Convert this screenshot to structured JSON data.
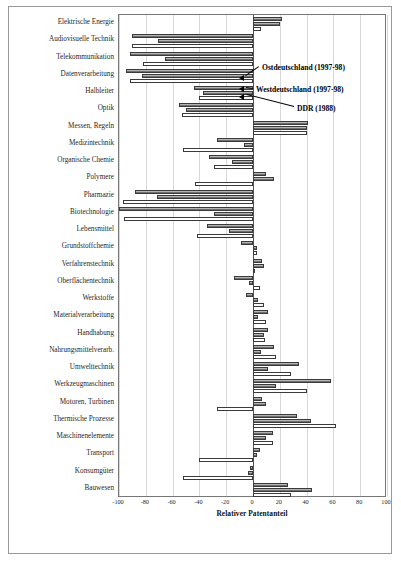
{
  "chart_data": {
    "type": "bar",
    "orientation": "horizontal",
    "title": "",
    "xlabel": "Relativer Patentanteil",
    "ylabel": "",
    "xlim": [
      -100,
      100
    ],
    "xticks": [
      -100,
      -80,
      -60,
      -40,
      -20,
      0,
      20,
      40,
      60,
      80,
      100
    ],
    "grid": true,
    "legend_position": "inside-annotations",
    "categories": [
      "Elektrische Energie",
      "Audiovisuelle Technik",
      "Telekommunikation",
      "Datenverarbeitung",
      "Halbleiter",
      "Optik",
      "Messen, Regeln",
      "Medizintechnik",
      "Organische Chemie",
      "Polymere",
      "Pharmazie",
      "Biotechnologie",
      "Lebensmittel",
      "Grundstoffchemie",
      "Verfahrenstechnik",
      "Oberflächentechnik",
      "Werkstoffe",
      "Materialverarbeitung",
      "Handhabung",
      "Nahrungsmittelverarb.",
      "Umwelttechnik",
      "Werkzeugmaschinen",
      "Motoren, Turbinen",
      "Thermische Prozesse",
      "Maschinenelemente",
      "Transport",
      "Konsumgüter",
      "Bauwesen"
    ],
    "series": [
      {
        "name": "Ostdeutschland (1997-98)",
        "style": "hatched",
        "values": [
          22,
          -90,
          -92,
          -95,
          -44,
          -55,
          41,
          -27,
          -33,
          10,
          -88,
          -103,
          -34,
          -9,
          7,
          -14,
          -5,
          11,
          11,
          16,
          34,
          58,
          7,
          33,
          15,
          5,
          -2,
          26
        ]
      },
      {
        "name": "Westdeutschland (1997-98)",
        "style": "hatched",
        "values": [
          20,
          -71,
          -66,
          -83,
          -37,
          -50,
          40,
          -7,
          -16,
          16,
          -72,
          -29,
          -18,
          3,
          8,
          -3,
          4,
          4,
          8,
          6,
          11,
          17,
          10,
          43,
          10,
          3,
          -4,
          44
        ]
      },
      {
        "name": "DDR (1988)",
        "style": "white",
        "values": [
          6,
          -90,
          -82,
          -92,
          -40,
          -53,
          40,
          -52,
          -29,
          -43,
          -97,
          -96,
          -42,
          3,
          1,
          5,
          8,
          10,
          9,
          17,
          28,
          40,
          -27,
          62,
          15,
          -40,
          -52,
          28
        ]
      }
    ]
  },
  "annotations": {
    "ost_label": "Ostdeutschland (1997-98)",
    "west_label": "Westdeutschland (1997-98)",
    "ddr_label": "DDR (1988)"
  },
  "axis": {
    "x_title": "Relativer Patentanteil",
    "tick_labels": [
      "-100",
      "-80",
      "-60",
      "-40",
      "-20",
      "0",
      "20",
      "40",
      "60",
      "80",
      "100"
    ]
  }
}
